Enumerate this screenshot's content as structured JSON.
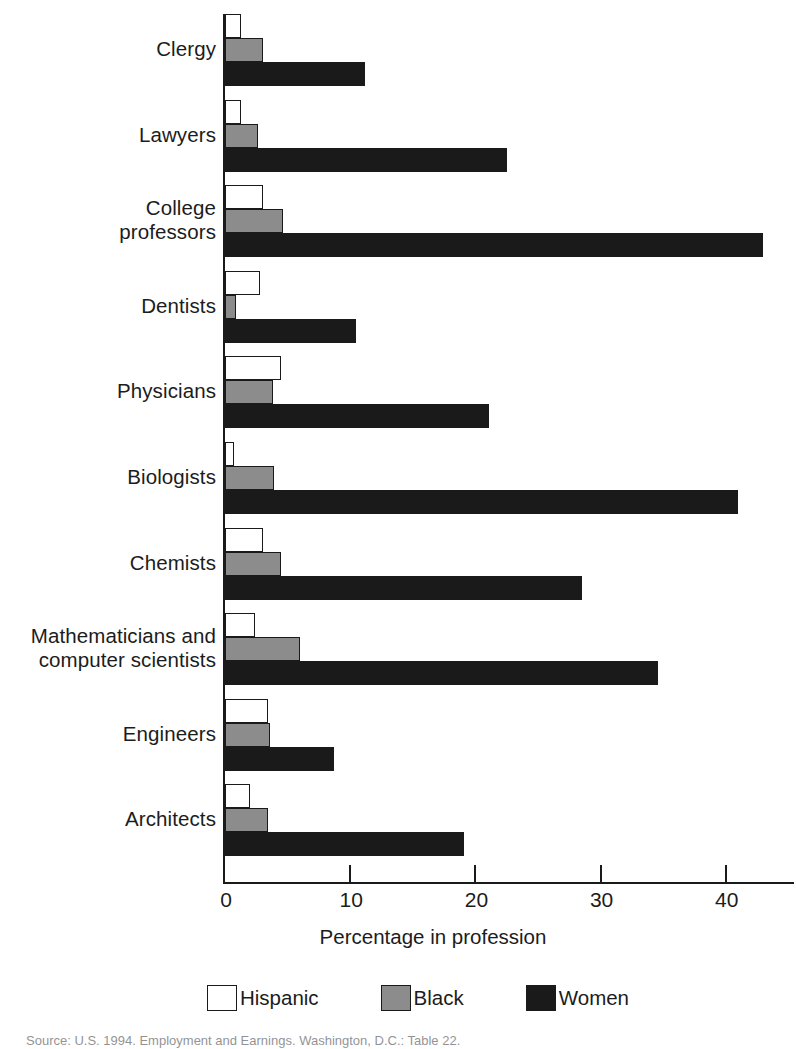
{
  "chart_data": {
    "type": "bar",
    "orientation": "horizontal",
    "title": "",
    "xlabel": "Percentage in profession",
    "ylabel": "",
    "xlim": [
      0,
      44
    ],
    "xticks": [
      0,
      10,
      20,
      30,
      40
    ],
    "xtick_labels": [
      "0",
      "10",
      "20",
      "30",
      "40"
    ],
    "grid": false,
    "legend_position": "bottom",
    "categories": [
      "Clergy",
      "Lawyers",
      "College professors",
      "Dentists",
      "Physicians",
      "Biologists",
      "Chemists",
      "Mathematicians and computer scientists",
      "Engineers",
      "Architects"
    ],
    "series": [
      {
        "name": "Hispanic",
        "color": "#ffffff",
        "values": [
          1.3,
          1.3,
          3.0,
          2.8,
          4.5,
          0.7,
          3.0,
          2.4,
          3.4,
          2.0
        ]
      },
      {
        "name": "Black",
        "color": "#8c8c8c",
        "values": [
          3.0,
          2.6,
          4.6,
          0.9,
          3.8,
          3.9,
          4.5,
          6.0,
          3.6,
          3.4
        ]
      },
      {
        "name": "Women",
        "color": "#1a1a1a",
        "values": [
          11.2,
          22.5,
          43.0,
          10.5,
          21.1,
          41.0,
          28.5,
          34.6,
          8.7,
          19.1
        ]
      }
    ]
  },
  "axis": {
    "x_title": "Percentage in profession",
    "tick_labels": [
      "0",
      "10",
      "20",
      "30",
      "40"
    ]
  },
  "categories": [
    {
      "label_line1": "Clergy",
      "label_line2": ""
    },
    {
      "label_line1": "Lawyers",
      "label_line2": ""
    },
    {
      "label_line1": "College",
      "label_line2": "professors"
    },
    {
      "label_line1": "Dentists",
      "label_line2": ""
    },
    {
      "label_line1": "Physicians",
      "label_line2": ""
    },
    {
      "label_line1": "Biologists",
      "label_line2": ""
    },
    {
      "label_line1": "Chemists",
      "label_line2": ""
    },
    {
      "label_line1": "Mathematicians and",
      "label_line2": "computer scientists"
    },
    {
      "label_line1": "Engineers",
      "label_line2": ""
    },
    {
      "label_line1": "Architects",
      "label_line2": ""
    }
  ],
  "legend": {
    "items": [
      {
        "label": "Hispanic",
        "swatch": "hispanic"
      },
      {
        "label": "Black",
        "swatch": "black"
      },
      {
        "label": "Women",
        "swatch": "women"
      }
    ]
  },
  "source": {
    "text": "Source: U.S. 1994. Employment and Earnings. Washington, D.C.: Table 22."
  }
}
